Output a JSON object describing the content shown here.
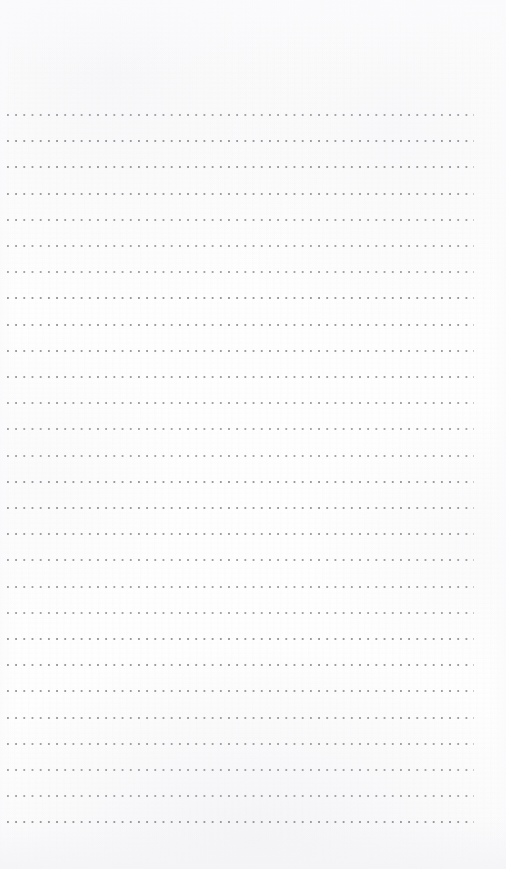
{
  "document": {
    "kind": "dotted-line-notebook-paper",
    "title": "Blank dotted line writing paper",
    "page_width": 506,
    "page_height": 869,
    "content_text": "",
    "has_handwriting": false,
    "has_printed_text": false
  },
  "colors": {
    "page_background": "#fefefe",
    "paper_tint": "#fdfdfd",
    "dot_color": "#9a9a9e",
    "dot_color_faint": "#c9c9cf",
    "texture_shade": "#f4f4f7"
  },
  "ruling": {
    "style": "dotted",
    "line_count": 28,
    "first_line_y": 114,
    "line_spacing": 26.2,
    "line_left": 7,
    "line_right": 472,
    "line_width": 465,
    "dot_size": 2,
    "dot_pitch": 8.2,
    "dot_shape": "square"
  },
  "margins": {
    "top_margin_height": 114,
    "bottom_margin_height": 37,
    "left_margin_width": 7,
    "right_margin_width": 34,
    "top_margin_label": "",
    "bottom_margin_label": ""
  }
}
